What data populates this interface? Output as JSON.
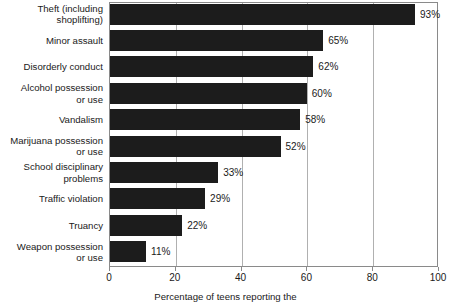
{
  "chart_data": {
    "type": "bar",
    "orientation": "horizontal",
    "title": "",
    "xlabel": "Percentage of teens reporting the",
    "ylabel": "",
    "xlim": [
      0,
      100
    ],
    "xticks": [
      0,
      20,
      40,
      60,
      80,
      100
    ],
    "xtick_labels": [
      "0",
      "20",
      "40",
      "60",
      "80",
      "100"
    ],
    "grid": true,
    "grid_axis": "x",
    "legend": false,
    "bar_color": "#1c1c1c",
    "grid_color": "#b0b0b0",
    "axis_color": "#8a8a8a",
    "value_suffix": "%",
    "categories": [
      "Theft (including\nshoplifting)",
      "Minor assault",
      "Disorderly conduct",
      "Alcohol possession\nor use",
      "Vandalism",
      "Marijuana possession\nor use",
      "School disciplinary\nproblems",
      "Traffic violation",
      "Truancy",
      "Weapon possession\nor use"
    ],
    "values": [
      93,
      65,
      62,
      60,
      58,
      52,
      33,
      29,
      22,
      11
    ],
    "value_labels": [
      "93%",
      "65%",
      "62%",
      "60%",
      "58%",
      "52%",
      "33%",
      "29%",
      "22%",
      "11%"
    ]
  }
}
